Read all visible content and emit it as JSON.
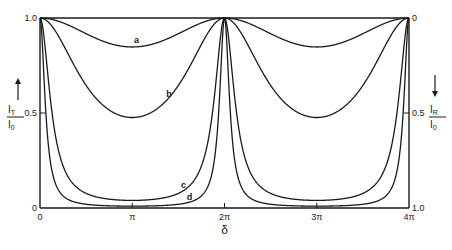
{
  "chart_data": {
    "type": "line",
    "title": "",
    "xlabel": "δ",
    "ylabel_left": {
      "numerator": "I_T",
      "denominator": "I_0",
      "arrow": "up"
    },
    "ylabel_right": {
      "numerator": "I_R",
      "denominator": "I_0",
      "arrow": "down"
    },
    "xlim": [
      0,
      12.566
    ],
    "ylim": [
      0,
      1.0
    ],
    "x_ticks": [
      {
        "value": 0,
        "label": "0"
      },
      {
        "value": 3.1416,
        "label": "π"
      },
      {
        "value": 6.2832,
        "label": "2π"
      },
      {
        "value": 9.4248,
        "label": "3π"
      },
      {
        "value": 12.566,
        "label": "4π"
      }
    ],
    "y_ticks_left": [
      {
        "value": 0,
        "label": "0"
      },
      {
        "value": 0.5,
        "label": "0.5"
      },
      {
        "value": 1.0,
        "label": "1.0"
      }
    ],
    "y_ticks_right": [
      {
        "value": 0,
        "label": "1.0"
      },
      {
        "value": 0.5,
        "label": "0.5"
      },
      {
        "value": 1.0,
        "label": "0"
      }
    ],
    "function": "I_T/I_0 = 1 / (1 + F·sin²(δ/2))",
    "series": [
      {
        "name": "a",
        "F": 0.18,
        "min_value": 0.85
      },
      {
        "name": "b",
        "F": 1.1,
        "min_value": 0.47
      },
      {
        "name": "c",
        "F": 24,
        "min_value": 0.04
      },
      {
        "name": "d",
        "F": 100,
        "min_value": 0.01
      }
    ],
    "grid": false,
    "legend": "inline labels near curves"
  }
}
